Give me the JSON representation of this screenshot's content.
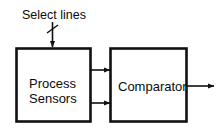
{
  "diagram": {
    "canvas": {
      "width": 224,
      "height": 134,
      "background": "#ffffff"
    },
    "stroke_color": "#111111",
    "text_color": "#0b0b0b",
    "labels": {
      "select_lines": "Select lines"
    },
    "blocks": [
      {
        "id": "process-sensors",
        "line1": "Process",
        "line2": "Sensors",
        "x": 16,
        "y": 48,
        "w": 74,
        "h": 74
      },
      {
        "id": "comparator",
        "line1": "Comparator",
        "line2": "",
        "x": 110,
        "y": 48,
        "w": 76,
        "h": 74
      }
    ],
    "connections": [
      {
        "id": "select-lines-bus",
        "from": "select-lines-label",
        "to": "process-sensors",
        "bus": true
      },
      {
        "id": "sensor-out-upper",
        "from": "process-sensors",
        "to": "comparator",
        "bus": false
      },
      {
        "id": "sensor-out-lower",
        "from": "process-sensors",
        "to": "comparator",
        "bus": false
      },
      {
        "id": "comparator-output",
        "from": "comparator",
        "to": "",
        "bus": false
      }
    ]
  }
}
